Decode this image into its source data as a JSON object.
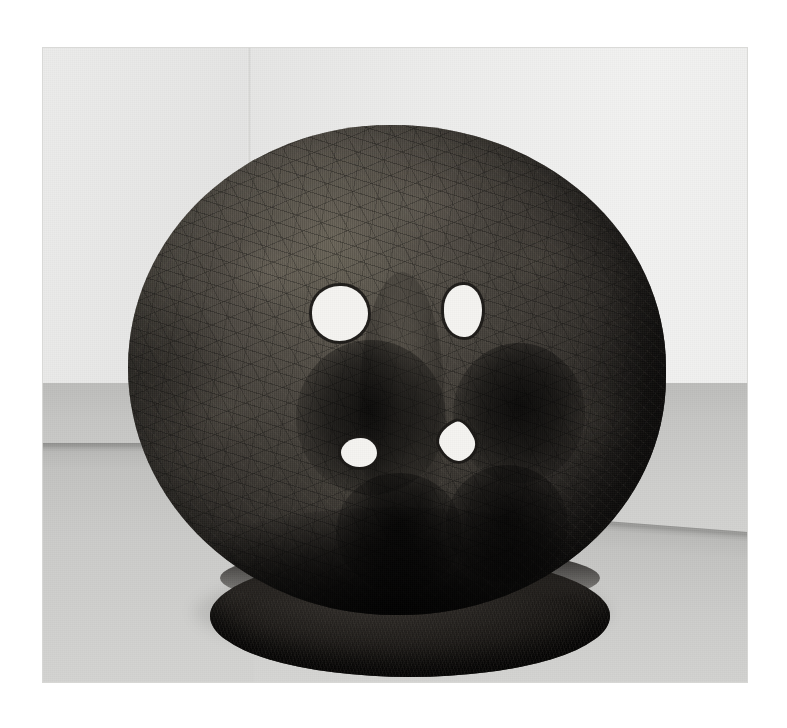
{
  "image": {
    "kind": "photograph",
    "medium": "black-and-white gelatin silver photograph",
    "subject": "large spherical sculpture on an oval plinth in a gallery corner",
    "orientation": "landscape",
    "canvas": {
      "width_px": 787,
      "height_px": 728,
      "background_hex": "#ffffff"
    },
    "print_area": {
      "left_px": 42,
      "top_px": 47,
      "width_px": 706,
      "height_px": 636
    }
  },
  "palette": {
    "page_white": "#ffffff",
    "wall_light": "#f2f2f1",
    "wall_mid": "#e7e7e6",
    "wall_shadow": "#e2e2e1",
    "floor_dark": "#b8b8b6",
    "floor_mid": "#cdcdcb",
    "floor_light": "#dbdbd9",
    "skirting_shadow": "#767674",
    "sculpture_highlight": "#6b6659",
    "sculpture_mid": "#433f39",
    "sculpture_dark": "#1d1b19",
    "sculpture_deepest": "#0b0a09",
    "aperture_white": "#f5f4f1"
  },
  "scene": {
    "wall_left": {
      "label": "gallery wall left plane",
      "tone": "light warm grey"
    },
    "wall_right": {
      "label": "gallery wall right plane",
      "tone": "brighter light grey"
    },
    "wall_corner": {
      "label": "vertical corner seam",
      "x_px": 248
    },
    "floor": {
      "label": "concrete gallery floor",
      "texture": "fine speckled aggregate"
    },
    "skirting_left": {
      "label": "wall-floor junction shadow, left",
      "y_px": 443
    },
    "skirting_right": {
      "label": "wall-floor junction shadow, right",
      "y_px": 493,
      "slope": "descends to the right"
    },
    "cast_shadow": {
      "label": "cast shadow on floor beneath sculpture"
    }
  },
  "sculpture": {
    "name": "spherical vessel sculpture",
    "form": "near-spherical mass, slightly flattened, seated on an oval ring base",
    "surface": "densely crazed and woven texture with radiating crack networks and mottled light patches",
    "sphere": {
      "label": "sphere body",
      "left_px": 128,
      "top_px": 125,
      "width_px": 538,
      "height_px": 490
    },
    "base": {
      "label": "oval plinth ring",
      "left_px": 210,
      "top_px": 555,
      "width_px": 400,
      "height_px": 122
    },
    "apertures": [
      {
        "id": "upper-left",
        "label": "upper left aperture",
        "shape": "round",
        "center_px": [
          340,
          313
        ],
        "size_px": [
          56,
          55
        ]
      },
      {
        "id": "upper-right",
        "label": "upper right aperture",
        "shape": "oval, vertical",
        "center_px": [
          463,
          311
        ],
        "size_px": [
          38,
          52
        ]
      },
      {
        "id": "lower-left",
        "label": "lower left aperture",
        "shape": "oval, horizontal",
        "center_px": [
          359,
          452
        ],
        "size_px": [
          36,
          29
        ]
      },
      {
        "id": "lower-right",
        "label": "lower right aperture",
        "shape": "crescent / leaf",
        "center_px": [
          457,
          442
        ],
        "size_px": [
          34,
          38
        ]
      }
    ],
    "aperture_count": 4
  },
  "lighting": {
    "key_direction": "upper left",
    "description": "soft diffuse gallery light from the upper left, leaving the lower right of the sphere in deep shadow"
  }
}
